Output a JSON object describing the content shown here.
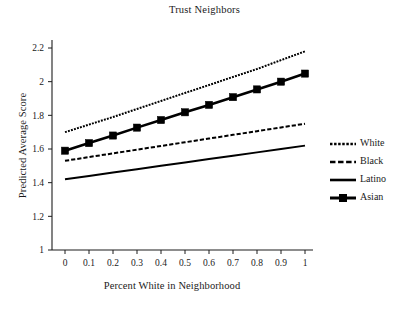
{
  "chart_data": {
    "type": "line",
    "title": "Trust Neighbors",
    "xlabel": "Percent White in Neighborhood",
    "ylabel": "Predicted Average Score",
    "xlim": [
      0,
      1
    ],
    "ylim": [
      1,
      2.2
    ],
    "xticks": [
      "0",
      "0.1",
      "0.2",
      "0.3",
      "0.4",
      "0.5",
      "0.6",
      "0.7",
      "0.8",
      "0.9",
      "1"
    ],
    "xtick_values": [
      0,
      0.1,
      0.2,
      0.3,
      0.4,
      0.5,
      0.6,
      0.7,
      0.8,
      0.9,
      1
    ],
    "yticks": [
      "1",
      "1.2",
      "1.4",
      "1.6",
      "1.8",
      "2",
      "2.2"
    ],
    "ytick_values": [
      1,
      1.2,
      1.4,
      1.6,
      1.8,
      2,
      2.2
    ],
    "grid": false,
    "legend_position": "right",
    "x": [
      0,
      0.1,
      0.2,
      0.3,
      0.4,
      0.5,
      0.6,
      0.7,
      0.8,
      0.9,
      1
    ],
    "series": [
      {
        "name": "White",
        "style": "dotted",
        "marker": "none",
        "color": "#000000",
        "values": [
          1.7,
          1.745,
          1.79,
          1.838,
          1.885,
          1.933,
          1.98,
          2.028,
          2.075,
          2.128,
          2.18
        ]
      },
      {
        "name": "Black",
        "style": "dashed",
        "marker": "none",
        "color": "#000000",
        "values": [
          1.53,
          1.552,
          1.574,
          1.596,
          1.618,
          1.64,
          1.662,
          1.684,
          1.706,
          1.728,
          1.75
        ]
      },
      {
        "name": "Latino",
        "style": "solid",
        "marker": "none",
        "color": "#000000",
        "values": [
          1.42,
          1.44,
          1.46,
          1.48,
          1.5,
          1.52,
          1.54,
          1.56,
          1.58,
          1.6,
          1.62
        ]
      },
      {
        "name": "Asian",
        "style": "solid",
        "marker": "square",
        "color": "#000000",
        "values": [
          1.59,
          1.635,
          1.68,
          1.727,
          1.772,
          1.818,
          1.862,
          1.908,
          1.954,
          2.0,
          2.048
        ]
      }
    ]
  },
  "legend": {
    "items": [
      {
        "label": "White"
      },
      {
        "label": "Black"
      },
      {
        "label": "Latino"
      },
      {
        "label": "Asian"
      }
    ]
  }
}
